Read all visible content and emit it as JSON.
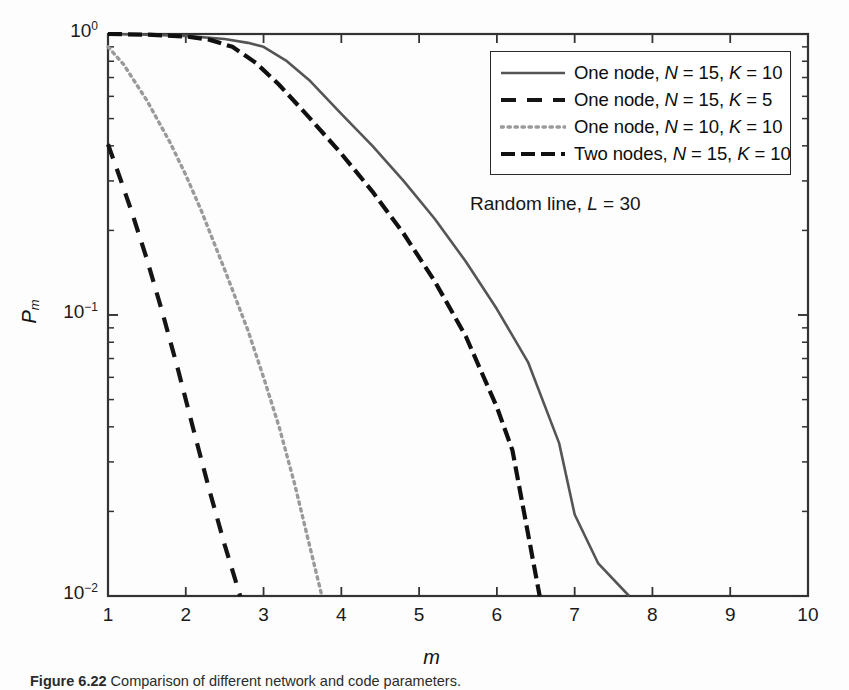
{
  "figure": {
    "caption_prefix": "Figure 6.22",
    "caption_body": "Comparison of different network and code parameters."
  },
  "axes": {
    "xlabel": "m",
    "ylabel_base": "P",
    "ylabel_sub": "m",
    "x_ticks": [
      "1",
      "2",
      "3",
      "4",
      "5",
      "6",
      "7",
      "8",
      "9",
      "10"
    ],
    "y_ticks": [
      {
        "mantissa": "10",
        "exponent": "0"
      },
      {
        "mantissa": "10",
        "exponent": "-1"
      },
      {
        "mantissa": "10",
        "exponent": "-2"
      }
    ]
  },
  "annotation": {
    "prefix": "Random line, ",
    "symbol": "L",
    "suffix": " = 30"
  },
  "legend": {
    "entries": [
      {
        "style": "solid",
        "label": "One node, N = 15, K = 10"
      },
      {
        "style": "dashed",
        "label": "One node, N = 15, K = 5"
      },
      {
        "style": "dotted",
        "label": "One node, N = 10, K = 10"
      },
      {
        "style": "dashdot",
        "label": "Two nodes, N = 15, K = 10"
      }
    ]
  },
  "chart_data": {
    "type": "line",
    "title": "",
    "xlabel": "m",
    "ylabel": "P_m",
    "xlim": [
      1,
      10
    ],
    "ylim": [
      0.01,
      1
    ],
    "yscale": "log",
    "xscale": "linear",
    "grid": false,
    "legend_position": "upper right",
    "annotations": [
      "Random line, L = 30"
    ],
    "series": [
      {
        "name": "One node, N = 15, K = 10",
        "style": "solid",
        "color": "#555555",
        "x": [
          1.0,
          1.5,
          2.0,
          2.5,
          2.8,
          3.0,
          3.3,
          3.6,
          4.0,
          4.4,
          4.8,
          5.2,
          5.6,
          6.0,
          6.4,
          6.8,
          7.0,
          7.3,
          7.7
        ],
        "y": [
          1.0,
          0.995,
          0.985,
          0.96,
          0.93,
          0.9,
          0.8,
          0.68,
          0.52,
          0.4,
          0.3,
          0.22,
          0.155,
          0.105,
          0.068,
          0.035,
          0.0195,
          0.0131,
          0.01
        ]
      },
      {
        "name": "One node, N = 15, K = 5",
        "style": "dashed",
        "color": "#151515",
        "x": [
          1.0,
          1.15,
          1.3,
          1.5,
          1.7,
          1.9,
          2.1,
          2.3,
          2.5,
          2.7
        ],
        "y": [
          0.405,
          0.31,
          0.235,
          0.158,
          0.102,
          0.064,
          0.039,
          0.024,
          0.0152,
          0.01
        ]
      },
      {
        "name": "One node, N = 10, K = 10",
        "style": "dotted",
        "color": "#9a9a9a",
        "x": [
          1.0,
          1.2,
          1.5,
          1.8,
          2.0,
          2.2,
          2.5,
          2.8,
          3.0,
          3.2,
          3.4,
          3.6,
          3.75
        ],
        "y": [
          0.9,
          0.78,
          0.58,
          0.41,
          0.315,
          0.235,
          0.145,
          0.088,
          0.06,
          0.04,
          0.025,
          0.0148,
          0.01
        ]
      },
      {
        "name": "Two nodes, N = 15, K = 10",
        "style": "dashdot",
        "color": "#101010",
        "x": [
          1.0,
          1.5,
          2.0,
          2.3,
          2.6,
          2.9,
          3.2,
          3.6,
          4.0,
          4.4,
          4.8,
          5.2,
          5.6,
          6.0,
          6.2,
          6.55
        ],
        "y": [
          1.0,
          0.995,
          0.98,
          0.955,
          0.9,
          0.79,
          0.66,
          0.5,
          0.375,
          0.275,
          0.195,
          0.132,
          0.084,
          0.047,
          0.033,
          0.01
        ]
      }
    ]
  }
}
